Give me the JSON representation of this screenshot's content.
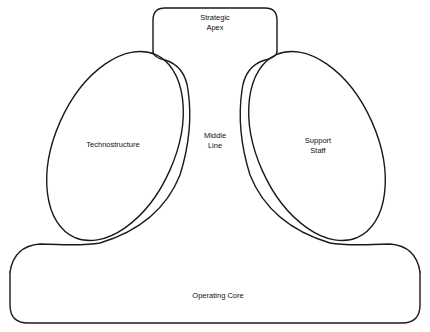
{
  "diagram": {
    "type": "organizational-structure",
    "parts": [
      {
        "id": "strategic_apex",
        "lines": [
          "Strategic",
          "Apex"
        ]
      },
      {
        "id": "technostructure",
        "lines": [
          "Technostructure"
        ]
      },
      {
        "id": "middle_line",
        "lines": [
          "Middle",
          "Line"
        ]
      },
      {
        "id": "support_staff",
        "lines": [
          "Support",
          "Staff"
        ]
      },
      {
        "id": "operating_core",
        "lines": [
          "Operating Core"
        ]
      }
    ],
    "colors": {
      "line": "#1a1a1a",
      "background": "#ffffff",
      "text": "#111111"
    }
  }
}
